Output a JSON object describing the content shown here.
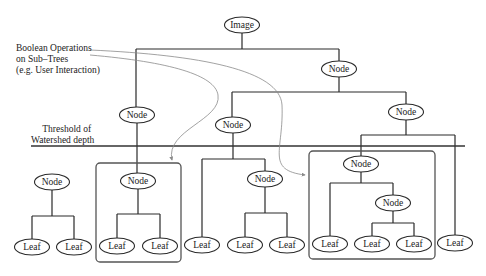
{
  "diagram": {
    "annotations": {
      "boolean_ops": [
        "Boolean Operations",
        "on Sub–Trees",
        "(e.g. User Interaction)"
      ],
      "threshold": [
        "Threshold of",
        "Watershed depth"
      ]
    },
    "colors": {
      "line": "#2a2a2a",
      "curve": "#8a8a8a",
      "box": "#555555",
      "background": "#ffffff"
    },
    "nodes": [
      {
        "id": "image",
        "label": "Image",
        "x": 242,
        "y": 25
      },
      {
        "id": "n-right",
        "label": "Node",
        "x": 339,
        "y": 69
      },
      {
        "id": "n-left",
        "label": "Node",
        "x": 137,
        "y": 115
      },
      {
        "id": "n-mid",
        "label": "Node",
        "x": 233,
        "y": 125
      },
      {
        "id": "n-rr",
        "label": "Node",
        "x": 406,
        "y": 112
      },
      {
        "id": "n-sub0",
        "label": "Node",
        "x": 52,
        "y": 182
      },
      {
        "id": "n-sub1",
        "label": "Node",
        "x": 138,
        "y": 181
      },
      {
        "id": "n-sub2",
        "label": "Node",
        "x": 265,
        "y": 179
      },
      {
        "id": "n-sub3",
        "label": "Node",
        "x": 361,
        "y": 164
      },
      {
        "id": "n-sub3b",
        "label": "Node",
        "x": 393,
        "y": 203
      },
      {
        "id": "leaf1",
        "label": "Leaf",
        "x": 32,
        "y": 247
      },
      {
        "id": "leaf2",
        "label": "Leaf",
        "x": 74,
        "y": 247
      },
      {
        "id": "leaf3",
        "label": "Leaf",
        "x": 117,
        "y": 246
      },
      {
        "id": "leaf4",
        "label": "Leaf",
        "x": 160,
        "y": 246
      },
      {
        "id": "leaf5",
        "label": "Leaf",
        "x": 202,
        "y": 245
      },
      {
        "id": "leaf6",
        "label": "Leaf",
        "x": 245,
        "y": 245
      },
      {
        "id": "leaf7",
        "label": "Leaf",
        "x": 287,
        "y": 245
      },
      {
        "id": "leaf8",
        "label": "Leaf",
        "x": 330,
        "y": 244
      },
      {
        "id": "leaf9",
        "label": "Leaf",
        "x": 372,
        "y": 244
      },
      {
        "id": "leaf10",
        "label": "Leaf",
        "x": 414,
        "y": 244
      },
      {
        "id": "leaf11",
        "label": "Leaf",
        "x": 455,
        "y": 243
      }
    ]
  }
}
